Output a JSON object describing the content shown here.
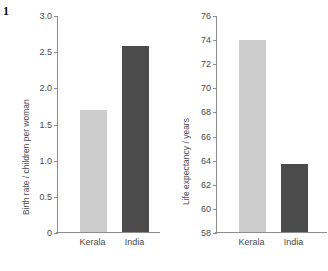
{
  "figure": {
    "number": "1"
  },
  "chart_data": [
    {
      "type": "bar",
      "title": "",
      "xlabel": "",
      "ylabel": "Birth rate / children per woman",
      "categories": [
        "Kerala",
        "India"
      ],
      "values": [
        1.7,
        2.58
      ],
      "ylim": [
        0,
        3.0
      ],
      "yticks": [
        "0",
        "0.5",
        "1.0",
        "1.5",
        "2.0",
        "2.5",
        "3.0"
      ],
      "ytick_values": [
        0,
        0.5,
        1.0,
        1.5,
        2.0,
        2.5,
        3.0
      ],
      "grid": false,
      "legend": "none",
      "bar_colors": [
        "#cdcdcd",
        "#4b4b4b"
      ]
    },
    {
      "type": "bar",
      "title": "",
      "xlabel": "",
      "ylabel": "Life expectancy / years",
      "categories": [
        "Kerala",
        "India"
      ],
      "values": [
        74.0,
        63.7
      ],
      "ylim": [
        58,
        76
      ],
      "yticks": [
        "58",
        "60",
        "62",
        "64",
        "66",
        "68",
        "70",
        "72",
        "74",
        "76"
      ],
      "ytick_values": [
        58,
        60,
        62,
        64,
        66,
        68,
        70,
        72,
        74,
        76
      ],
      "grid": false,
      "legend": "none",
      "bar_colors": [
        "#cdcdcd",
        "#4b4b4b"
      ]
    }
  ],
  "colors": {
    "light_bar": "#cdcdcd",
    "dark_bar": "#4b4b4b",
    "axis": "#8d8d8d",
    "text": "#4a4a4a",
    "background": "#ffffff"
  }
}
